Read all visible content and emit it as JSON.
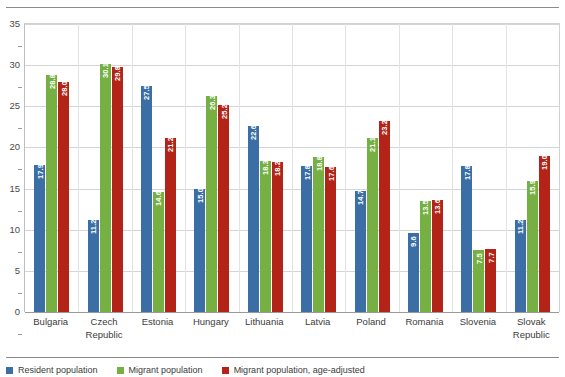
{
  "top_rule": true,
  "clipped_title": "",
  "chart_data": {
    "type": "bar",
    "title": "",
    "subtitle": "",
    "xlabel": "",
    "ylabel": "",
    "ylim": [
      0,
      35
    ],
    "yticks": [
      0,
      5,
      10,
      15,
      20,
      25,
      30,
      35
    ],
    "ytick_labels": [
      "0",
      "5",
      "10",
      "15",
      "20",
      "25",
      "30",
      "35"
    ],
    "grid": true,
    "legend_position": "bottom",
    "orientation": "vertical",
    "grouping": "grouped",
    "data_labels": true,
    "data_label_orientation": "vertical",
    "categories": [
      "Bulgaria",
      "Czech Republic",
      "Estonia",
      "Hungary",
      "Lithuania",
      "Latvia",
      "Poland",
      "Romania",
      "Slovenia",
      "Slovak Republic"
    ],
    "series": [
      {
        "name": "Resident population",
        "color": "#3a6ea5",
        "values": [
          17.9,
          11.2,
          27.5,
          15.0,
          22.6,
          17.8,
          14.7,
          9.6,
          17.8,
          11.2
        ],
        "labels": [
          "17.9",
          "11.2",
          "27.5",
          "15.0",
          "22.6",
          "17.8",
          "14.7",
          "9.6",
          "17.8",
          "11.2"
        ]
      },
      {
        "name": "Migrant population",
        "color": "#76b043",
        "values": [
          28.8,
          30.1,
          14.6,
          26.3,
          18.3,
          18.8,
          21.1,
          13.5,
          7.5,
          15.9
        ],
        "labels": [
          "28.8",
          "30.1",
          "14.6",
          "26.3",
          "18.3",
          "18.8",
          "21.1",
          "13.5",
          "7.5",
          "15.9"
        ]
      },
      {
        "name": "Migrant population, age-adjusted",
        "color": "#b32317",
        "values": [
          28.0,
          29.8,
          21.2,
          25.2,
          18.2,
          17.6,
          23.2,
          13.6,
          7.7,
          19.0
        ],
        "labels": [
          "28.0",
          "29.8",
          "21.2",
          "25.2",
          "18.2",
          "17.6",
          "23.2",
          "13.6",
          "7.7",
          "19.0"
        ]
      }
    ]
  },
  "legend": {
    "items": [
      {
        "label": "Resident population",
        "color": "#3a6ea5"
      },
      {
        "label": "Migrant population",
        "color": "#76b043"
      },
      {
        "label": "Migrant population, age-adjusted",
        "color": "#b32317"
      }
    ]
  }
}
